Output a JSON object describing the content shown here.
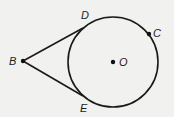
{
  "diagram": {
    "type": "circle-with-tangents",
    "circle": {
      "center_label": "O",
      "cx": 113,
      "cy": 62,
      "r": 45
    },
    "points": [
      {
        "label": "B",
        "x": 23,
        "y": 61,
        "lx": 9,
        "ly": 65
      },
      {
        "label": "D",
        "x": 83,
        "y": 28,
        "lx": 81,
        "ly": 19
      },
      {
        "label": "E",
        "x": 83,
        "y": 96,
        "lx": 80,
        "ly": 112
      },
      {
        "label": "C",
        "x": 149,
        "y": 34,
        "lx": 153,
        "ly": 37
      },
      {
        "label": "O",
        "x": 113,
        "y": 62,
        "lx": 119,
        "ly": 66
      }
    ],
    "segments": [
      [
        "B",
        "D"
      ],
      [
        "B",
        "E"
      ]
    ],
    "stroke": "#1a1a1a"
  }
}
